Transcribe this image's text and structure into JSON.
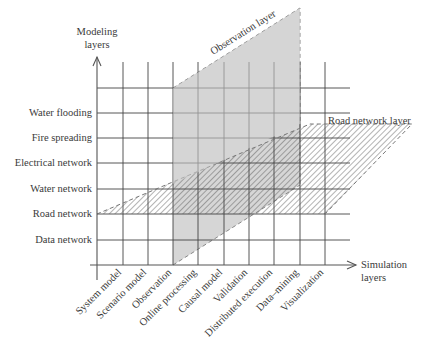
{
  "diagram": {
    "type": "layered grid diagram",
    "y_axis": {
      "label_line1": "Modeling",
      "label_line2": "layers"
    },
    "x_axis": {
      "label_line1": "Simulation",
      "label_line2": "layers"
    },
    "modeling_layers": [
      "Water flooding",
      "Fire spreading",
      "Electrical network",
      "Water network",
      "Road network",
      "Data network"
    ],
    "simulation_layers": [
      "System model",
      "Scenario model",
      "Observation",
      "Online processing",
      "Causal model",
      "Validation",
      "Distributed execution",
      "Data–mining",
      "Visualization"
    ],
    "planes": [
      {
        "name": "observation-layer",
        "label": "Observation layer",
        "fill": "#d3d3d3",
        "style": "solid gray, dashed border"
      },
      {
        "name": "road-network-layer",
        "label": "Road network layer",
        "fill": "#ffffff",
        "style": "diagonal hatching, dashed border"
      }
    ],
    "colors": {
      "grid": "#444444",
      "observation_fill": "#d3d3d3",
      "hatch": "#555555",
      "text": "#3a3a3a"
    }
  }
}
